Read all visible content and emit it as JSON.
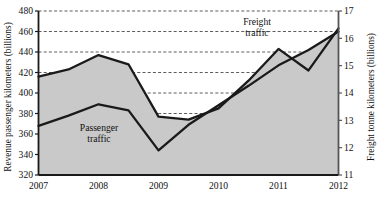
{
  "chart_data": {
    "type": "area",
    "title": "",
    "xlabel": "",
    "x": [
      2007,
      2008,
      2009,
      2010,
      2011,
      2012
    ],
    "xticklabels": [
      "2007",
      "2008",
      "2009",
      "2010",
      "2011",
      "2012"
    ],
    "grid": true,
    "legend_position": "inline-annotations",
    "left_axis": {
      "label": "Revenue passenger kilometers (billions)",
      "ticks": [
        320,
        340,
        360,
        380,
        400,
        420,
        440,
        460,
        480
      ],
      "ticklabels": [
        "320",
        "340",
        "360",
        "380",
        "400",
        "420",
        "440",
        "460",
        "480"
      ],
      "lim": [
        320,
        480
      ]
    },
    "right_axis": {
      "label": "Freight tonne kilometers (billions)",
      "ticks": [
        11,
        12,
        13,
        14,
        15,
        16,
        17
      ],
      "ticklabels": [
        "11",
        "12",
        "13",
        "14",
        "15",
        "16",
        "17"
      ],
      "lim": [
        11,
        17
      ]
    },
    "series": [
      {
        "name": "Freight traffic",
        "axis": "right",
        "annotation": "Freight\ntraffic",
        "annotation_line1": "Freight",
        "annotation_line2": "traffic",
        "color": "#1a1a1a",
        "x": [
          2007.0,
          2007.5,
          2008.0,
          2008.5,
          2009.0,
          2009.5,
          2010.0,
          2010.5,
          2011.0,
          2011.5,
          2012.0
        ],
        "values_left_scale": [
          416,
          423,
          437,
          428,
          377,
          374,
          385,
          412,
          443,
          422,
          463
        ],
        "values": [
          14.6,
          14.86,
          15.39,
          15.05,
          13.14,
          13.03,
          13.44,
          14.45,
          15.61,
          14.83,
          16.36
        ]
      },
      {
        "name": "Passenger traffic",
        "axis": "left",
        "annotation": "Passenger\ntraffic",
        "annotation_line1": "Passenger",
        "annotation_line2": "traffic",
        "color": "#1a1a1a",
        "x": [
          2007.0,
          2007.5,
          2008.0,
          2008.5,
          2009.0,
          2009.5,
          2010.0,
          2010.5,
          2011.0,
          2011.5,
          2012.0
        ],
        "values": [
          368,
          378,
          389,
          383,
          344,
          369,
          388,
          407,
          427,
          442,
          460
        ],
        "values_right_scale": [
          12.8,
          13.18,
          13.59,
          13.36,
          11.9,
          12.84,
          13.55,
          14.26,
          15.01,
          15.58,
          16.25
        ]
      }
    ],
    "fill": {
      "between": [
        "Freight traffic",
        "Passenger traffic"
      ],
      "color": "#c9c9c9"
    }
  }
}
